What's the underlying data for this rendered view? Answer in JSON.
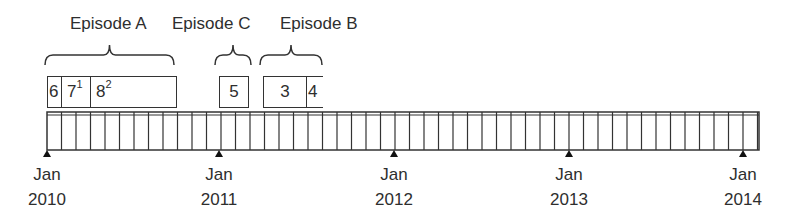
{
  "diagram": {
    "type": "timeline",
    "episodes": [
      {
        "label": "Episode A",
        "label_x": 70,
        "brace": [
          45,
          174
        ]
      },
      {
        "label": "Episode C",
        "label_x": 172,
        "brace": [
          215,
          251
        ]
      },
      {
        "label": "Episode B",
        "label_x": 280,
        "brace": [
          260,
          322
        ]
      }
    ],
    "boxes": [
      {
        "number": "6",
        "sup": "",
        "x": 47,
        "w": 15
      },
      {
        "number": "7",
        "sup": "1",
        "x": 61,
        "w": 30
      },
      {
        "number": "8",
        "sup": "2",
        "x": 90,
        "w": 87
      },
      {
        "number": "5",
        "sup": "",
        "x": 219,
        "w": 30,
        "center": true
      },
      {
        "number": "3",
        "sup": "",
        "x": 263,
        "w": 44,
        "center": true
      },
      {
        "number": "4",
        "sup": "",
        "x": 306,
        "w": 17,
        "open_right": true
      }
    ],
    "axis": {
      "start_x": 47,
      "end_x": 759,
      "month_px": 14.5,
      "ticks": [
        {
          "month": "Jan",
          "year": "2010",
          "x": 47
        },
        {
          "month": "Jan",
          "year": "2011",
          "x": 219
        },
        {
          "month": "Jan",
          "year": "2012",
          "x": 394
        },
        {
          "month": "Jan",
          "year": "2013",
          "x": 569
        },
        {
          "month": "Jan",
          "year": "2014",
          "x": 743
        }
      ]
    },
    "colors": {
      "line": "#333333",
      "text": "#2e2e2e"
    }
  }
}
